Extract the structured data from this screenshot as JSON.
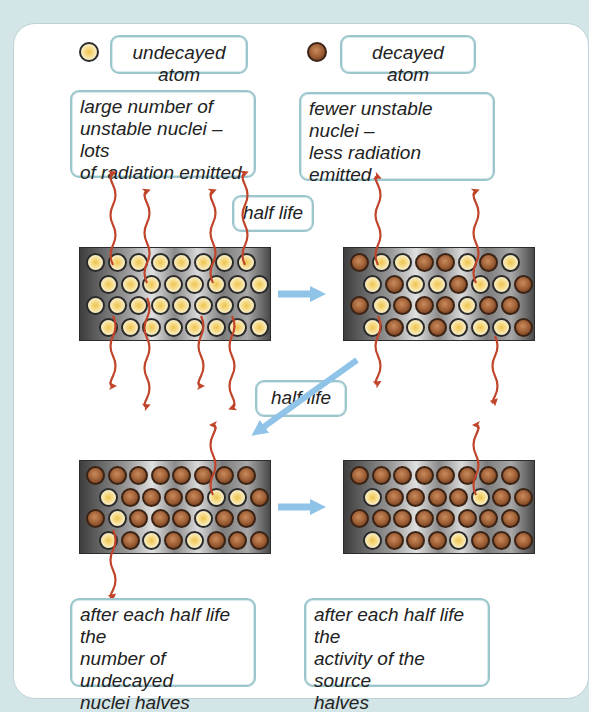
{
  "legend": {
    "undecayed": {
      "label": "undecayed atom",
      "icon": "undecayed-atom-icon"
    },
    "decayed": {
      "label": "decayed atom",
      "icon": "decayed-atom-icon"
    }
  },
  "captions": {
    "top_left": [
      "large number of",
      "unstable nuclei – lots",
      "of radiation emitted"
    ],
    "top_right": [
      "fewer unstable nuclei –",
      "less radiation emitted"
    ],
    "bottom_left": [
      "after each half life the",
      "number of undecayed",
      "nuclei halves"
    ],
    "bottom_right": [
      "after each half life the",
      "activity of the source",
      "halves"
    ]
  },
  "half_life_labels": [
    "half life",
    "half life"
  ],
  "colors": {
    "background": "#d4e5e7",
    "box_border": "#9cc6cc",
    "radiation_arrow": "#c0452a",
    "transition_arrow": "#8fc3e8",
    "undecayed": "#f5dc8e",
    "decayed": "#8b4f2b"
  },
  "blocks": [
    {
      "name": "block-1",
      "rows": [
        "UUUUUUUU",
        "UUUUUUUU",
        "UUUUUUUU",
        "UUUUUUUU"
      ]
    },
    {
      "name": "block-2",
      "rows": [
        "DUUDDUDU",
        "UDUUDUUD",
        "DUDDDUDD",
        "UDUDUUUD"
      ]
    },
    {
      "name": "block-3",
      "rows": [
        "DDDDDDDD",
        "UDDDDUUD",
        "DUDDDUDD",
        "UDUDUDDD"
      ]
    },
    {
      "name": "block-4",
      "rows": [
        "DDDDDDDD",
        "UDDDDUDD",
        "DDDDDDDD",
        "UDDDUDDD"
      ]
    }
  ]
}
